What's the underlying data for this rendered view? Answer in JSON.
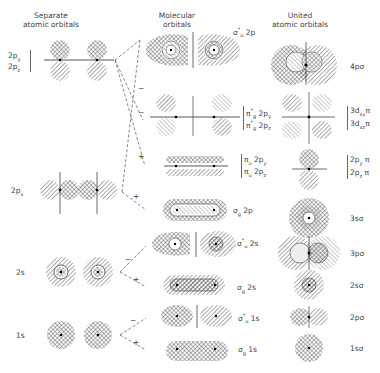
{
  "columns": {
    "separate": {
      "line1": "Separate",
      "line2": "atomic orbitals"
    },
    "molecular": {
      "line1": "Molecular",
      "line2": "orbitals"
    },
    "united": {
      "line1": "United",
      "line2": "atomic orbitals"
    }
  },
  "separate_labels": {
    "p_y": "2p",
    "p_y_sub": "y",
    "p_z": "2p",
    "p_z_sub": "z",
    "p_x": "2p",
    "p_x_sub": "x",
    "s2": "2s",
    "s1": "1s"
  },
  "molecular_labels": {
    "sigma_u_2p": "σ*u 2p",
    "pi_g_2py": "π*g 2py",
    "pi_g_2pz": "π*g 2pz",
    "pi_u_2py": "πu 2py",
    "pi_u_2pz": "πu 2pz",
    "sigma_g_2p": "σg 2p",
    "sigma_u_2s": "σ*u 2s",
    "sigma_g_2s": "σg 2s",
    "sigma_u_1s": "σ*u 1s",
    "sigma_g_1s": "σg 1s"
  },
  "molecular_label_parts": {
    "sigma": "σ",
    "pi": "π",
    "star": "*",
    "u": "u",
    "g": "g",
    "t2p": " 2p",
    "t2py": " 2p",
    "t2pz": " 2p",
    "t2s": " 2s",
    "t1s": " 1s",
    "y": "y",
    "z": "z"
  },
  "united_labels": {
    "p4_sigma": "4pσ",
    "d3xy_pi": "3d",
    "d3xy_sub": "xy",
    "d3xz_pi": "3d",
    "d3xz_sub": "xz",
    "pi_sym": "π",
    "p2y_pi": "2p",
    "p2y_sub": "y",
    "p2z_pi": "2p",
    "p2z_sub": "z",
    "s3_sigma": "3sσ",
    "p3_sigma": "3pσ",
    "s2_sigma": "2sσ",
    "p2_sigma": "2pσ",
    "s1_sigma": "1sσ"
  },
  "correlation_signs": {
    "minus": "−",
    "plus": "+"
  },
  "colors": {
    "ink": "#444444",
    "hatch": "#555555",
    "background": "#ffffff"
  }
}
